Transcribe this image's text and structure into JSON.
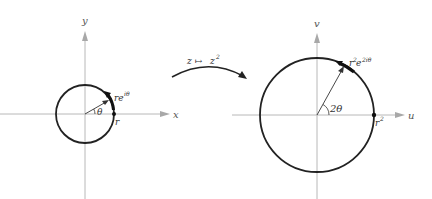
{
  "diagram": {
    "colors": {
      "axis": "#b8b8b8",
      "curve": "#222222",
      "text": "#333333",
      "background": "#ffffff"
    },
    "left_plane": {
      "x_axis_label": "x",
      "y_axis_label": "y",
      "point_label": "re",
      "point_label_sup": "iθ",
      "angle_label": "θ",
      "radius_label": "r"
    },
    "mapping": {
      "label_z": "z",
      "label_arrow": "↦",
      "label_w": "z",
      "label_w_sup": "2"
    },
    "right_plane": {
      "x_axis_label": "u",
      "y_axis_label": "v",
      "point_label": "r",
      "point_label_sup1": "2",
      "point_label_e": "e",
      "point_label_sup2": "2iθ",
      "angle_label": "2θ",
      "radius_label": "r",
      "radius_label_sup": "2"
    }
  }
}
